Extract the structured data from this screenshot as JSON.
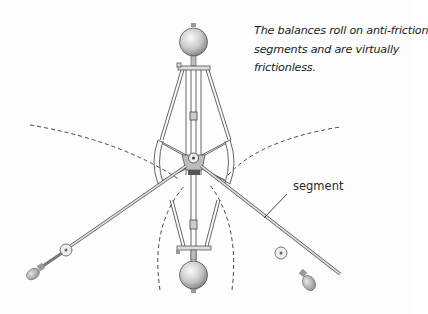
{
  "diagram": {
    "caption_lines": [
      "The balances roll on anti-friction",
      "segments and are virtually",
      "frictionless."
    ],
    "labels": {
      "segment": "segment"
    },
    "components": [
      {
        "name": "top-ball-weight"
      },
      {
        "name": "bottom-ball-weight"
      },
      {
        "name": "left-arm-with-knob"
      },
      {
        "name": "right-arm-with-knob"
      },
      {
        "name": "anti-friction-segment-frame"
      },
      {
        "name": "swing-path-dashed-arcs"
      }
    ],
    "colors": {
      "line": "#555555",
      "fill_light": "#e8e8e8",
      "text": "#1c1c1c"
    }
  }
}
